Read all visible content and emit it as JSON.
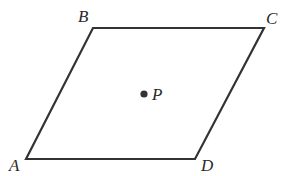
{
  "diagram": {
    "type": "parallelogram",
    "vertices": [
      {
        "name": "A",
        "x": 26,
        "y": 159
      },
      {
        "name": "B",
        "x": 93,
        "y": 28
      },
      {
        "name": "C",
        "x": 264,
        "y": 28
      },
      {
        "name": "D",
        "x": 195,
        "y": 159
      }
    ],
    "point": {
      "name": "P",
      "x": 144,
      "y": 94
    },
    "labels": {
      "A": "A",
      "B": "B",
      "C": "C",
      "D": "D",
      "P": "P"
    },
    "stroke_color": "#333333"
  }
}
